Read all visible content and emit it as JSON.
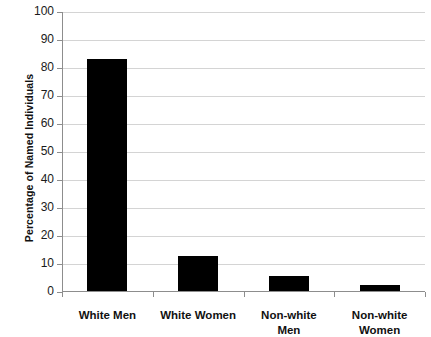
{
  "chart_data": {
    "type": "bar",
    "title": "",
    "subtitle": "",
    "xlabel": "",
    "ylabel": "Percentage of Named Individuals",
    "categories": [
      "White Men",
      "White Women",
      "Non-white Men",
      "Non-white Women"
    ],
    "category_lines": [
      [
        "White Men"
      ],
      [
        "White Women"
      ],
      [
        "Non-white",
        "Men"
      ],
      [
        "Non-white",
        "Women"
      ]
    ],
    "values": [
      83,
      12.5,
      5.5,
      2
    ],
    "ylim": [
      0,
      100
    ],
    "ytick_values": [
      0,
      10,
      20,
      30,
      40,
      50,
      60,
      70,
      80,
      90,
      100
    ],
    "ytick_labels": [
      "0",
      "10",
      "20",
      "30",
      "40",
      "50",
      "60",
      "70",
      "80",
      "90",
      "100"
    ],
    "grid": true,
    "grid_axis": "y",
    "legend": false,
    "legend_position": "none",
    "bar_color": "#000000",
    "grid_color": "#d4d4d4",
    "axis_color": "#8d8d8d",
    "background_color": "#ffffff"
  },
  "axis": {
    "y_title": "Percentage of Named Individuals"
  }
}
